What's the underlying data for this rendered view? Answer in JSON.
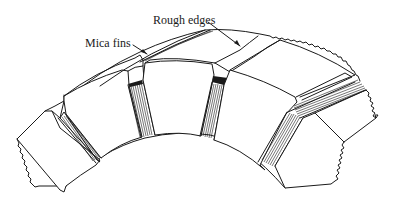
{
  "figure": {
    "labels": [
      {
        "id": "rough-edges",
        "text": "Rough edges"
      },
      {
        "id": "mica-fins",
        "text": "Mica fins"
      }
    ],
    "colors": {
      "line": "#1a1a1a",
      "background": "#ffffff"
    }
  }
}
